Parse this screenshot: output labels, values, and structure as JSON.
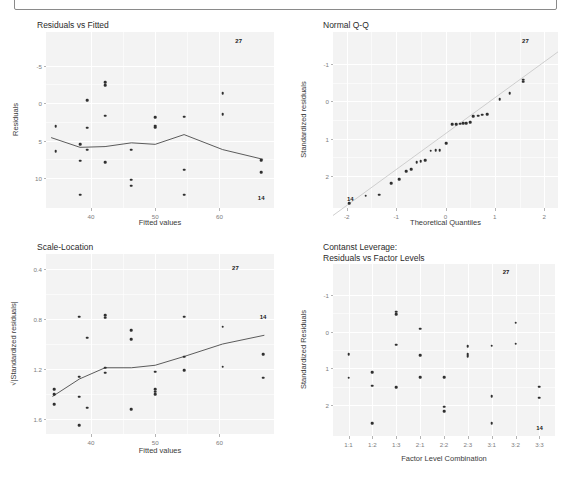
{
  "header": {
    "note": ""
  },
  "panels": [
    {
      "id": "residuals-vs-fitted",
      "title": "Residuals vs Fitted",
      "xlabel": "Fitted values",
      "ylabel": "Residuals",
      "xticks": [
        "40",
        "50",
        "60"
      ],
      "yticks": [
        "10",
        "5",
        "0",
        "-5"
      ],
      "point_labels": [
        {
          "text": "27",
          "x": 63.0,
          "y": 13.3
        },
        {
          "text": "14",
          "x": 66.5,
          "y": -7.6
        }
      ]
    },
    {
      "id": "normal-qq",
      "title": "Normal Q-Q",
      "xlabel": "Theoretical Quantiles",
      "ylabel": "Standardized residuals",
      "xticks": [
        "-2",
        "-1",
        "0",
        "1",
        "2"
      ],
      "yticks": [
        "2",
        "1",
        "0",
        "-1"
      ],
      "point_labels": [
        {
          "text": "27",
          "x": 1.62,
          "y": 2.62
        },
        {
          "text": "14",
          "x": -1.93,
          "y": -1.62
        }
      ]
    },
    {
      "id": "scale-location",
      "title": "Scale-Location",
      "xlabel": "Fitted values",
      "ylabel": "√|Standardized residuals|",
      "xticks": [
        "40",
        "50",
        "60"
      ],
      "yticks": [
        "1.6",
        "1.2",
        "0.8",
        "0.4"
      ],
      "point_labels": [
        {
          "text": "27",
          "x": 62.5,
          "y": 1.61
        },
        {
          "text": "14",
          "x": 66.8,
          "y": 1.22
        }
      ]
    },
    {
      "id": "constant-leverage",
      "title": "Contanst Leverage:\nResiduals vs Factor Levels",
      "xlabel": "Factor Level Combination",
      "ylabel": "Standardized Residuals",
      "xticks": [
        "1:1",
        "1:2",
        "1:3",
        "2:1",
        "2:2",
        "2:3",
        "3:1",
        "3:2",
        "3:3"
      ],
      "yticks": [
        "2",
        "1",
        "0",
        "-1"
      ],
      "point_labels": [
        {
          "text": "27",
          "x": 7.6,
          "y": 2.62
        },
        {
          "text": "14",
          "x": 9.0,
          "y": -1.62
        }
      ]
    }
  ],
  "chart_data": [
    {
      "type": "scatter",
      "title": "Residuals vs Fitted",
      "xlabel": "Fitted values",
      "ylabel": "Residuals",
      "xlim": [
        33.0,
        68.5
      ],
      "ylim": [
        -9.0,
        14.5
      ],
      "xticks": [
        40,
        50,
        60
      ],
      "yticks": [
        -5,
        0,
        5,
        10
      ],
      "grid": true,
      "legend": "none",
      "points": [
        [
          34.5,
          1.9
        ],
        [
          34.5,
          -1.4
        ],
        [
          38.3,
          -0.5
        ],
        [
          38.3,
          -2.7
        ],
        [
          38.3,
          -7.2
        ],
        [
          39.4,
          5.4
        ],
        [
          39.4,
          1.7
        ],
        [
          39.4,
          -1.2
        ],
        [
          42.2,
          7.8
        ],
        [
          42.2,
          7.4
        ],
        [
          42.2,
          3.3
        ],
        [
          42.2,
          -2.9
        ],
        [
          46.3,
          -1.2
        ],
        [
          46.3,
          -5.2
        ],
        [
          46.3,
          -6.0
        ],
        [
          50.0,
          3.1
        ],
        [
          50.0,
          2.0
        ],
        [
          50.0,
          1.8
        ],
        [
          54.5,
          3.2
        ],
        [
          54.5,
          -3.9
        ],
        [
          54.5,
          -7.2
        ],
        [
          60.5,
          6.3
        ],
        [
          60.5,
          3.5
        ],
        [
          66.5,
          -2.6
        ],
        [
          66.5,
          -4.2
        ]
      ],
      "trend_line": [
        [
          33.8,
          0.4
        ],
        [
          38.3,
          -0.9
        ],
        [
          42.2,
          -0.8
        ],
        [
          46.3,
          -0.3
        ],
        [
          50.0,
          -0.5
        ],
        [
          54.5,
          0.8
        ],
        [
          60.5,
          -1.2
        ],
        [
          66.8,
          -2.5
        ]
      ],
      "annotations": [
        {
          "text": "27",
          "x": 63.0,
          "y": 13.3
        },
        {
          "text": "14",
          "x": 66.5,
          "y": -7.6
        }
      ]
    },
    {
      "type": "scatter",
      "title": "Normal Q-Q",
      "xlabel": "Theoretical Quantiles",
      "ylabel": "Standardized residuals",
      "xlim": [
        -2.28,
        2.28
      ],
      "ylim": [
        -1.85,
        2.85
      ],
      "xticks": [
        -2,
        -1,
        0,
        1,
        2
      ],
      "yticks": [
        -1,
        0,
        1,
        2
      ],
      "grid": true,
      "legend": "none",
      "points": [
        [
          -1.95,
          -1.72
        ],
        [
          -1.62,
          -1.52
        ],
        [
          -1.34,
          -1.5
        ],
        [
          -1.1,
          -1.18
        ],
        [
          -0.94,
          -1.08
        ],
        [
          -0.8,
          -0.86
        ],
        [
          -0.7,
          -0.82
        ],
        [
          -0.58,
          -0.62
        ],
        [
          -0.5,
          -0.6
        ],
        [
          -0.41,
          -0.58
        ],
        [
          -0.3,
          -0.32
        ],
        [
          -0.2,
          -0.3
        ],
        [
          -0.12,
          -0.3
        ],
        [
          0.02,
          -0.12
        ],
        [
          0.14,
          0.38
        ],
        [
          0.22,
          0.38
        ],
        [
          0.3,
          0.4
        ],
        [
          0.36,
          0.42
        ],
        [
          0.42,
          0.42
        ],
        [
          0.5,
          0.44
        ],
        [
          0.56,
          0.6
        ],
        [
          0.66,
          0.62
        ],
        [
          0.74,
          0.64
        ],
        [
          0.84,
          0.65
        ],
        [
          1.1,
          1.05
        ],
        [
          1.3,
          1.22
        ],
        [
          1.58,
          1.52
        ],
        [
          1.58,
          1.58
        ]
      ],
      "reference_line": [
        [
          -2.28,
          -2.05
        ],
        [
          2.28,
          2.32
        ]
      ],
      "annotations": [
        {
          "text": "27",
          "x": 1.62,
          "y": 2.62
        },
        {
          "text": "14",
          "x": -1.93,
          "y": -1.62
        }
      ]
    },
    {
      "type": "scatter",
      "title": "Scale-Location",
      "xlabel": "Fitted values",
      "ylabel": "√|Standardized residuals|",
      "xlim": [
        33.0,
        68.5
      ],
      "ylim": [
        0.28,
        1.72
      ],
      "xticks": [
        40,
        50,
        60
      ],
      "yticks": [
        0.4,
        0.8,
        1.2,
        1.6
      ],
      "grid": true,
      "legend": "none",
      "points": [
        [
          34.3,
          0.64
        ],
        [
          34.3,
          0.6
        ],
        [
          34.3,
          0.52
        ],
        [
          38.2,
          1.22
        ],
        [
          38.2,
          0.74
        ],
        [
          38.2,
          0.58
        ],
        [
          38.2,
          0.35
        ],
        [
          39.4,
          1.05
        ],
        [
          39.4,
          0.49
        ],
        [
          42.2,
          1.23
        ],
        [
          42.2,
          1.21
        ],
        [
          42.2,
          0.81
        ],
        [
          42.2,
          0.77
        ],
        [
          46.3,
          1.11
        ],
        [
          46.3,
          1.04
        ],
        [
          46.3,
          0.48
        ],
        [
          50.0,
          0.78
        ],
        [
          50.0,
          0.64
        ],
        [
          50.0,
          0.62
        ],
        [
          50.0,
          0.6
        ],
        [
          54.5,
          1.22
        ],
        [
          54.5,
          0.9
        ],
        [
          54.5,
          0.79
        ],
        [
          60.5,
          1.14
        ],
        [
          60.5,
          0.82
        ],
        [
          66.8,
          0.92
        ],
        [
          66.8,
          0.73
        ]
      ],
      "trend_line": [
        [
          34.0,
          0.58
        ],
        [
          38.2,
          0.72
        ],
        [
          42.2,
          0.81
        ],
        [
          46.3,
          0.81
        ],
        [
          50.0,
          0.83
        ],
        [
          54.5,
          0.9
        ],
        [
          60.5,
          1.0
        ],
        [
          67.0,
          1.07
        ]
      ],
      "annotations": [
        {
          "text": "27",
          "x": 62.5,
          "y": 1.61
        },
        {
          "text": "14",
          "x": 66.8,
          "y": 1.22
        }
      ]
    },
    {
      "type": "scatter",
      "title": "Contanst Leverage: Residuals vs Factor Levels",
      "xlabel": "Factor Level Combination",
      "ylabel": "Standardized Residuals",
      "categories": [
        "1:1",
        "1:2",
        "1:3",
        "2:1",
        "2:2",
        "2:3",
        "3:1",
        "3:2",
        "3:3"
      ],
      "ylim": [
        -1.85,
        2.85
      ],
      "yticks": [
        -1,
        0,
        1,
        2
      ],
      "grid": true,
      "legend": "none",
      "points": [
        [
          1,
          0.38
        ],
        [
          1,
          -0.26
        ],
        [
          2,
          -0.1
        ],
        [
          2,
          -0.48
        ],
        [
          2,
          -1.5
        ],
        [
          3,
          1.55
        ],
        [
          3,
          1.48
        ],
        [
          3,
          0.65
        ],
        [
          3,
          -0.52
        ],
        [
          4,
          1.08
        ],
        [
          4,
          0.35
        ],
        [
          4,
          -0.24
        ],
        [
          5,
          -0.24
        ],
        [
          5,
          -1.05
        ],
        [
          5,
          -1.18
        ],
        [
          6,
          0.6
        ],
        [
          6,
          0.38
        ],
        [
          6,
          0.33
        ],
        [
          7,
          0.62
        ],
        [
          7,
          -0.76
        ],
        [
          7,
          -1.5
        ],
        [
          8,
          1.25
        ],
        [
          8,
          0.67
        ],
        [
          9,
          -0.5
        ],
        [
          9,
          -0.8
        ]
      ],
      "annotations": [
        {
          "text": "27",
          "x": 7.6,
          "y": 2.62
        },
        {
          "text": "14",
          "x": 9.0,
          "y": -1.62
        }
      ]
    }
  ]
}
